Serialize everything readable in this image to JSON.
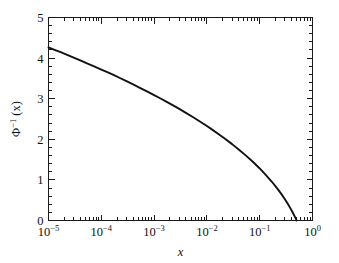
{
  "figure": {
    "background_color": "#ffffff",
    "foreground_color": "#111111",
    "curve_color": "#111111"
  },
  "chart_data": {
    "type": "line",
    "title": "",
    "subtitle": "",
    "xlabel": "x",
    "ylabel": "Φ⁻¹ (x)",
    "ylabel_parts": {
      "symbol": "Φ",
      "superscript": "-1",
      "argument": "(x)"
    },
    "xscale": "log",
    "yscale": "linear",
    "xlim": [
      1e-05,
      1.0
    ],
    "ylim": [
      0,
      5
    ],
    "grid": false,
    "legend": null,
    "legend_position": "none",
    "frame": "box",
    "ticks_direction": "in",
    "ticks_all_sides": true,
    "xticks": [
      1e-05,
      0.0001,
      0.001,
      0.01,
      0.1,
      1
    ],
    "xtick_labels": [
      {
        "mantissa": "10",
        "exponent": "−5"
      },
      {
        "mantissa": "10",
        "exponent": "−4"
      },
      {
        "mantissa": "10",
        "exponent": "−3"
      },
      {
        "mantissa": "10",
        "exponent": "−2"
      },
      {
        "mantissa": "10",
        "exponent": "−1"
      },
      {
        "mantissa": "10",
        "exponent": "0"
      }
    ],
    "xminor_ticks_per_decade": [
      2,
      3,
      4,
      5,
      6,
      7,
      8,
      9
    ],
    "yticks": [
      0,
      1,
      2,
      3,
      4,
      5
    ],
    "ytick_labels": [
      "0",
      "1",
      "2",
      "3",
      "4",
      "5"
    ],
    "yminor_tick_step": 0.2,
    "series": [
      {
        "name": "inverse-normal-cdf",
        "x": [
          1e-05,
          1.3e-05,
          1.7e-05,
          2.2e-05,
          3e-05,
          4e-05,
          5.5e-05,
          7.5e-05,
          0.0001,
          0.00013,
          0.00017,
          0.00022,
          0.0003,
          0.0004,
          0.00055,
          0.00075,
          0.001,
          0.0013,
          0.0017,
          0.0022,
          0.003,
          0.004,
          0.0055,
          0.0075,
          0.01,
          0.013,
          0.017,
          0.022,
          0.03,
          0.04,
          0.055,
          0.075,
          0.1,
          0.13,
          0.17,
          0.22,
          0.26,
          0.3,
          0.34,
          0.38,
          0.42,
          0.45,
          0.47,
          0.485,
          0.495,
          0.5
        ],
        "y": [
          4.265,
          4.205,
          4.145,
          4.085,
          4.013,
          3.944,
          3.862,
          3.79,
          3.719,
          3.653,
          3.588,
          3.516,
          3.432,
          3.353,
          3.262,
          3.174,
          3.09,
          3.011,
          2.929,
          2.848,
          2.748,
          2.652,
          2.543,
          2.432,
          2.326,
          2.226,
          2.12,
          2.014,
          1.881,
          1.751,
          1.598,
          1.44,
          1.282,
          1.126,
          0.954,
          0.772,
          0.643,
          0.524,
          0.412,
          0.305,
          0.202,
          0.126,
          0.075,
          0.038,
          0.013,
          0.0
        ],
        "description": "Inverse standard normal cumulative distribution function (upper-tail probit)"
      }
    ],
    "annotations": [],
    "key_points": [
      {
        "x": "1e-5",
        "y": "4.26"
      },
      {
        "x": "1e-4",
        "y": "3.72"
      },
      {
        "x": "1e-3",
        "y": "3.09"
      },
      {
        "x": "1e-2",
        "y": "2.33"
      },
      {
        "x": "1e-1",
        "y": "1.28"
      },
      {
        "x": "0.5",
        "y": "0.00"
      }
    ]
  }
}
